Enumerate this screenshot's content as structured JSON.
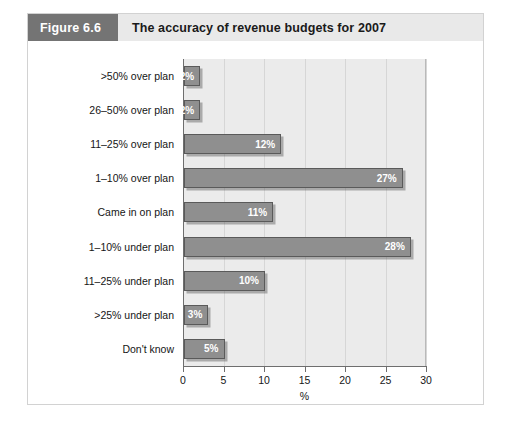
{
  "figure": {
    "number_label": "Figure 6.6",
    "title": "The accuracy of revenue budgets for 2007"
  },
  "colors": {
    "header_band": "#e9e9e9",
    "header_number_box": "#747474",
    "bar_fill": "#8f8f8f",
    "bar_border": "#5a5a5a",
    "plot_background": "#ebebeb",
    "gridline": "#d6d6d6",
    "axis": "#6e6e6e",
    "value_label": "#ffffff"
  },
  "chart_data": {
    "type": "bar",
    "orientation": "horizontal",
    "title": "The accuracy of revenue budgets for 2007",
    "xlabel": "%",
    "ylabel": "",
    "xlim": [
      0,
      30
    ],
    "xticks": [
      0,
      5,
      10,
      15,
      20,
      25,
      30
    ],
    "xtick_labels": [
      "0",
      "5",
      "10",
      "15",
      "20",
      "25",
      "30"
    ],
    "grid": "vertical",
    "legend": "none",
    "categories": [
      ">50% over plan",
      "26–50% over plan",
      "11–25% over plan",
      "1–10% over plan",
      "Came in on plan",
      "1–10% under plan",
      "11–25% under plan",
      ">25% under plan",
      "Don't know"
    ],
    "values": [
      2,
      2,
      12,
      27,
      11,
      28,
      10,
      3,
      5
    ],
    "value_labels": [
      "2%",
      "2%",
      "12%",
      "27%",
      "11%",
      "28%",
      "10%",
      "3%",
      "5%"
    ]
  }
}
